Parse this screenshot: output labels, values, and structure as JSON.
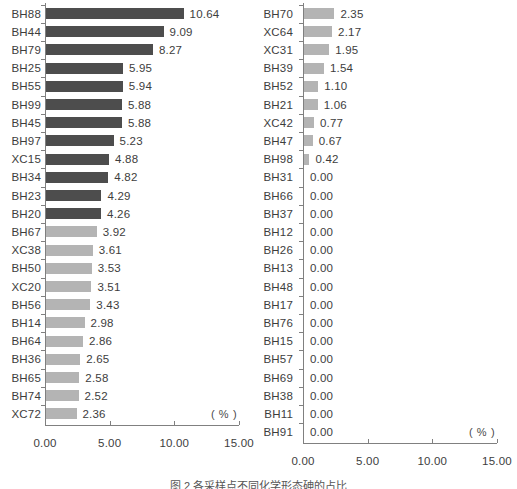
{
  "chart_data": [
    {
      "type": "bar",
      "orientation": "horizontal",
      "title": "",
      "xlabel": "( % )",
      "ylabel": "",
      "xlim": [
        0,
        15
      ],
      "xticks": [
        "0.00",
        "5.00",
        "10.00",
        "15.00"
      ],
      "xtick_values": [
        0,
        5,
        10,
        15
      ],
      "grid": false,
      "legend": "none",
      "panel": "left",
      "categories": [
        "BH88",
        "BH44",
        "BH79",
        "BH25",
        "BH55",
        "BH99",
        "BH45",
        "BH97",
        "XC15",
        "BH34",
        "BH23",
        "BH20",
        "BH67",
        "XC38",
        "BH50",
        "XC20",
        "BH56",
        "BH14",
        "BH64",
        "BH36",
        "BH65",
        "BH74",
        "XC72"
      ],
      "values": [
        10.64,
        9.09,
        8.27,
        5.95,
        5.94,
        5.88,
        5.88,
        5.23,
        4.88,
        4.82,
        4.29,
        4.26,
        3.92,
        3.61,
        3.53,
        3.51,
        3.43,
        2.98,
        2.86,
        2.65,
        2.58,
        2.52,
        2.36
      ],
      "value_labels": [
        "10.64",
        "9.09",
        "8.27",
        "5.95",
        "5.94",
        "5.88",
        "5.88",
        "5.23",
        "4.88",
        "4.82",
        "4.29",
        "4.26",
        "3.92",
        "3.61",
        "3.53",
        "3.51",
        "3.43",
        "2.98",
        "2.86",
        "2.65",
        "2.58",
        "2.52",
        "2.36"
      ],
      "bar_shades": [
        "dark",
        "dark",
        "dark",
        "dark",
        "dark",
        "dark",
        "dark",
        "dark",
        "dark",
        "dark",
        "dark",
        "dark",
        "light",
        "light",
        "light",
        "light",
        "light",
        "light",
        "light",
        "light",
        "light",
        "light",
        "light"
      ]
    },
    {
      "type": "bar",
      "orientation": "horizontal",
      "title": "",
      "xlabel": "( % )",
      "ylabel": "",
      "xlim": [
        0,
        15
      ],
      "xticks": [
        "0.00",
        "5.00",
        "10.00",
        "15.00"
      ],
      "xtick_values": [
        0,
        5,
        10,
        15
      ],
      "grid": false,
      "legend": "none",
      "panel": "right",
      "categories": [
        "BH70",
        "XC64",
        "XC31",
        "BH39",
        "BH52",
        "BH21",
        "XC42",
        "BH47",
        "BH98",
        "BH31",
        "BH66",
        "BH37",
        "BH12",
        "BH26",
        "BH13",
        "BH48",
        "BH17",
        "BH76",
        "BH15",
        "BH57",
        "BH69",
        "BH38",
        "BH11",
        "BH91"
      ],
      "values": [
        2.35,
        2.17,
        1.95,
        1.54,
        1.1,
        1.06,
        0.77,
        0.67,
        0.42,
        0.0,
        0.0,
        0.0,
        0.0,
        0.0,
        0.0,
        0.0,
        0.0,
        0.0,
        0.0,
        0.0,
        0.0,
        0.0,
        0.0,
        0.0
      ],
      "value_labels": [
        "2.35",
        "2.17",
        "1.95",
        "1.54",
        "1.10",
        "1.06",
        "0.77",
        "0.67",
        "0.42",
        "0.00",
        "0.00",
        "0.00",
        "0.00",
        "0.00",
        "0.00",
        "0.00",
        "0.00",
        "0.00",
        "0.00",
        "0.00",
        "0.00",
        "0.00",
        "0.00",
        "0.00"
      ],
      "bar_shades": [
        "light",
        "light",
        "light",
        "light",
        "light",
        "light",
        "light",
        "light",
        "light",
        "light",
        "light",
        "light",
        "light",
        "light",
        "light",
        "light",
        "light",
        "light",
        "light",
        "light",
        "light",
        "light",
        "light",
        "light"
      ]
    }
  ],
  "colors": {
    "bar_dark": "#4d4d4d",
    "bar_light": "#b4b4b4",
    "axis": "#808080",
    "text": "#3d3d3d"
  },
  "caption": "图 2 各采样点不同化学形态砷的占比"
}
